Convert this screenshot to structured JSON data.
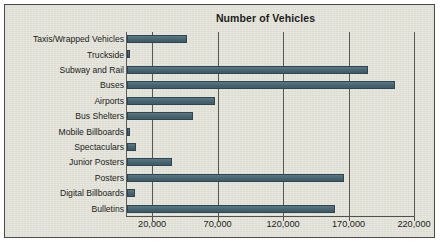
{
  "chart_data": {
    "type": "bar",
    "orientation": "horizontal",
    "title": "Number of Vehicles",
    "xlabel": "",
    "ylabel": "",
    "xlim": [
      0,
      220000
    ],
    "xticks": [
      20000,
      70000,
      120000,
      170000,
      220000
    ],
    "xtick_labels": [
      "20,000",
      "70,000",
      "120,000",
      "170,000",
      "220,000"
    ],
    "grid": true,
    "legend": null,
    "categories": [
      "Taxis/Wrapped Vehicles",
      "Truckside",
      "Subway and Rail",
      "Buses",
      "Airports",
      "Bus Shelters",
      "Mobile Billboards",
      "Spectaculars",
      "Junior Posters",
      "Posters",
      "Digital Billboards",
      "Bulletins"
    ],
    "values": [
      46000,
      2500,
      184000,
      204500,
      67400,
      50500,
      2500,
      7000,
      34500,
      165500,
      6000,
      158600
    ]
  },
  "colors": {
    "background": "#e2e2d8",
    "bar": "#4d6b7a",
    "bar_border": "#2f4652",
    "grid": "#565853",
    "text": "#1c1c1a",
    "panel_border": "#4a4a46"
  }
}
